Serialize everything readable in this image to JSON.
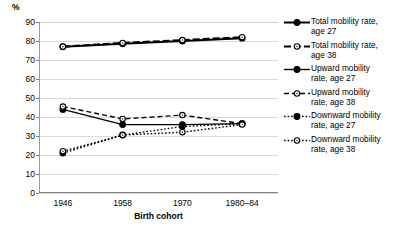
{
  "chart_data": {
    "type": "line",
    "title": "",
    "subtitle": "",
    "ylabel": "%",
    "xlabel": "Birth cohort",
    "categories": [
      "1946",
      "1958",
      "1970",
      "1980–84"
    ],
    "ylim": [
      0,
      90
    ],
    "yticks": [
      0,
      10,
      20,
      30,
      40,
      50,
      60,
      70,
      80,
      90
    ],
    "grid": true,
    "legend_position": "right",
    "series": [
      {
        "name": "Total mobility rate, age 27",
        "label_line1": "Total mobility rate,",
        "label_line2": "age 27",
        "marker": "filled-circle",
        "line_style": "solid",
        "line_width": 2,
        "values": [
          77,
          78.5,
          80,
          81.5
        ]
      },
      {
        "name": "Total mobility rate, age 38",
        "label_line1": "Total mobility rate,",
        "label_line2": "age 38",
        "marker": "open-circle",
        "line_style": "dashed",
        "line_width": 2,
        "values": [
          77,
          79,
          80.5,
          82
        ]
      },
      {
        "name": "Upward mobility rate, age 27",
        "label_line1": "Upward mobility",
        "label_line2": "rate, age 27",
        "marker": "filled-circle",
        "line_style": "solid",
        "line_width": 1.4,
        "values": [
          44,
          36,
          36,
          36.5
        ]
      },
      {
        "name": "Upward mobility rate, age 38",
        "label_line1": "Upward mobility",
        "label_line2": "rate, age 38",
        "marker": "open-circle",
        "line_style": "dashed",
        "line_width": 1.4,
        "values": [
          45.5,
          39,
          41,
          36.5
        ]
      },
      {
        "name": "Downward mobility rate, age 27",
        "label_line1": "Downward mobility",
        "label_line2": "rate, age 27",
        "marker": "filled-circle",
        "line_style": "dotted",
        "line_width": 1.4,
        "values": [
          21,
          30.5,
          35,
          36.5
        ]
      },
      {
        "name": "Downward mobility rate, age 38",
        "label_line1": "Downward mobility",
        "label_line2": "rate, age 38",
        "marker": "open-circle",
        "line_style": "dotted",
        "line_width": 1.4,
        "values": [
          22,
          30.5,
          32,
          36
        ]
      }
    ],
    "colors": {
      "series": "#000000",
      "grid": "#d9d9d9",
      "axis": "#808080",
      "background": "#ffffff"
    }
  }
}
